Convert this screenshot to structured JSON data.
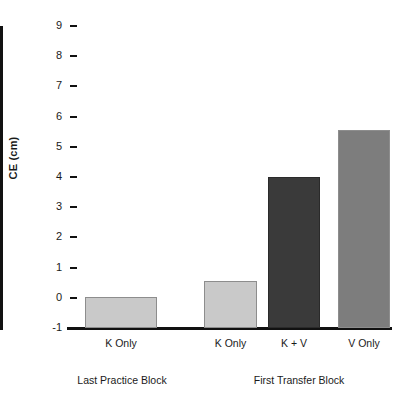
{
  "chart_data": {
    "type": "bar",
    "title": "",
    "xlabel": "",
    "ylabel": "CE (cm)",
    "ylim": [
      -1,
      9
    ],
    "yticks": [
      "9",
      "8",
      "7",
      "6",
      "5",
      "4",
      "3",
      "2",
      "1",
      "0",
      "-1"
    ],
    "grid": false,
    "legend": "none",
    "categories": [
      "K Only",
      "K Only",
      "K  + V",
      "V Only"
    ],
    "values": [
      0.03,
      0.55,
      4.0,
      5.55
    ],
    "bar_colors": [
      "#c9c9c9",
      "#c9c9c9",
      "#3a3a3a",
      "#7d7d7d"
    ],
    "groups": [
      {
        "label": "Last Practice Block",
        "categories": [
          "K Only"
        ]
      },
      {
        "label": "First Transfer Block",
        "categories": [
          "K Only",
          "K  + V",
          "V Only"
        ]
      }
    ]
  },
  "axis": {
    "y_label": "CE (cm)",
    "tick_labels": [
      "9",
      "8",
      "7",
      "6",
      "5",
      "4",
      "3",
      "2",
      "1",
      "0",
      "-1"
    ]
  },
  "bars": [
    {
      "label": "K Only",
      "value": 0.03,
      "color": "#c9c9c9"
    },
    {
      "label": "K Only",
      "value": 0.55,
      "color": "#c9c9c9"
    },
    {
      "label": "K  + V",
      "value": 4.0,
      "color": "#3a3a3a"
    },
    {
      "label": "V Only",
      "value": 5.55,
      "color": "#7d7d7d"
    }
  ],
  "group_labels": [
    {
      "label": "Last Practice Block"
    },
    {
      "label": "First Transfer Block"
    }
  ]
}
